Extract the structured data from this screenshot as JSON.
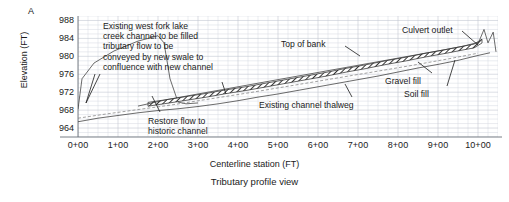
{
  "figure": {
    "panel_label": "A",
    "caption": "Tributary profile view",
    "xlabel": "Centerline station (FT)",
    "ylabel": "Elevation (FT)"
  },
  "annotations": [
    {
      "name": "existing-channel-fill-note",
      "text": "Existing west fork lake\ncreek channel to be filled\ntributary flow to be\nconveyed by new swale to\nconfluence with new channel",
      "x": 103,
      "y": 21,
      "align": "left"
    },
    {
      "name": "restore-flow-note",
      "text": "Restore flow to\nhistoric channel",
      "x": 148,
      "y": 116,
      "align": "left"
    },
    {
      "name": "top-of-bank-label",
      "text": "Top of bank",
      "x": 281,
      "y": 39,
      "align": "left"
    },
    {
      "name": "culvert-outlet-label",
      "text": "Culvert outlet",
      "x": 402,
      "y": 25,
      "align": "left"
    },
    {
      "name": "gravel-fill-label",
      "text": "Gravel fill",
      "x": 385,
      "y": 76,
      "align": "left"
    },
    {
      "name": "soil-fill-label",
      "text": "Soil fill",
      "x": 404,
      "y": 89,
      "align": "left"
    },
    {
      "name": "existing-channel-thalweg-label",
      "text": "Existing channel thalweg",
      "x": 259,
      "y": 100,
      "align": "left"
    }
  ],
  "chart_data": {
    "type": "line",
    "title": "Tributary profile view",
    "xlabel": "Centerline station (FT)",
    "ylabel": "Elevation (FT)",
    "xlim": [
      0,
      1050
    ],
    "ylim": [
      962,
      989
    ],
    "grid": true,
    "legend": "none",
    "xtick_labels": [
      "0+00",
      "1+00",
      "2+00",
      "3+00",
      "4+00",
      "5+00",
      "6+00",
      "7+00",
      "8+00",
      "9+00",
      "10+00"
    ],
    "xtick_values": [
      0,
      100,
      200,
      300,
      400,
      500,
      600,
      700,
      800,
      900,
      1000
    ],
    "ytick_labels": [
      "964",
      "968",
      "972",
      "976",
      "980",
      "984",
      "988"
    ],
    "ytick_values": [
      964,
      968,
      972,
      976,
      980,
      984,
      988
    ],
    "series": [
      {
        "name": "Existing west fork lake creek channel (to be filled)",
        "style": "thin-solid",
        "x": [
          0,
          10,
          40,
          90,
          150,
          200,
          215,
          230,
          250,
          270,
          300
        ],
        "y": [
          968.2,
          975.0,
          978.5,
          981.2,
          983.4,
          984.6,
          983.0,
          975.0,
          969.8,
          969.4,
          969.6
        ]
      },
      {
        "name": "Existing channel thalweg",
        "style": "thin-solid",
        "x": [
          0,
          50,
          100,
          150,
          200,
          250,
          300,
          350,
          400,
          450,
          500,
          550,
          600,
          650,
          700,
          750,
          800,
          850,
          900,
          950,
          1000,
          1030
        ],
        "y": [
          965.4,
          966.2,
          966.8,
          967.4,
          967.9,
          968.3,
          968.8,
          969.4,
          970.1,
          970.9,
          971.6,
          972.4,
          973.2,
          974.0,
          974.8,
          975.6,
          976.5,
          977.4,
          978.2,
          979.1,
          980.2,
          980.8
        ]
      },
      {
        "name": "Proposed channel centerline (hatched band)",
        "style": "hatched-band",
        "x": [
          175,
          220,
          270,
          320,
          370,
          420,
          470,
          520,
          570,
          620,
          670,
          720,
          770,
          820,
          870,
          920,
          960,
          990,
          1010
        ],
        "y": [
          969.3,
          969.9,
          970.6,
          971.3,
          972.1,
          972.8,
          973.6,
          974.4,
          975.2,
          976.0,
          976.9,
          977.7,
          978.6,
          979.4,
          980.3,
          981.1,
          981.8,
          982.3,
          983.4
        ]
      },
      {
        "name": "Top of bank",
        "style": "thin-solid",
        "x": [
          150,
          220,
          300,
          400,
          500,
          600,
          700,
          800,
          900,
          960,
          1000
        ],
        "y": [
          968.9,
          970.3,
          971.6,
          973.2,
          974.8,
          976.4,
          978.0,
          979.6,
          981.2,
          982.2,
          983.1
        ]
      },
      {
        "name": "Gravel / soil fill surface (dashed)",
        "style": "dashed",
        "x": [
          0,
          60,
          140,
          230,
          330,
          430,
          530,
          630,
          730,
          830,
          930,
          1000
        ],
        "y": [
          966.2,
          967.0,
          968.0,
          969.1,
          970.5,
          971.9,
          973.4,
          974.9,
          976.4,
          977.9,
          979.5,
          980.7
        ]
      },
      {
        "name": "Culvert outlet structure",
        "style": "thin-solid",
        "x": [
          1000,
          1015,
          1025,
          1038,
          1045
        ],
        "y": [
          982.8,
          986.0,
          983.0,
          985.4,
          981.0
        ]
      }
    ]
  }
}
